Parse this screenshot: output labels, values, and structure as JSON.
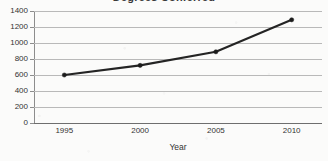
{
  "chart_data": {
    "type": "line",
    "title": "Degrees Conferred",
    "xlabel": "Year",
    "ylabel": "",
    "x": [
      1995,
      2000,
      2005,
      2010
    ],
    "categories": [
      "1995",
      "2000",
      "2005",
      "2010"
    ],
    "values": [
      600,
      720,
      890,
      1290
    ],
    "series": [
      {
        "name": "Degrees Conferred",
        "values": [
          600,
          720,
          890,
          1290
        ]
      }
    ],
    "xlim": [
      1993,
      2012
    ],
    "ylim": [
      0,
      1400
    ],
    "yticks": [
      0,
      200,
      400,
      600,
      800,
      1000,
      1200,
      1400
    ],
    "ytick_labels": [
      "0",
      "200",
      "400",
      "600",
      "800",
      "1000",
      "1200",
      "1400"
    ],
    "xticks": [
      1995,
      2000,
      2005,
      2010
    ],
    "xtick_labels": [
      "1995",
      "2000",
      "2005",
      "2010"
    ],
    "grid": true,
    "grid_axis": "y",
    "legend": false,
    "legend_position": "none",
    "marker": "circle",
    "line_color": "#242424",
    "marker_color": "#1c1c1c",
    "gridline_color": "#b9b9b9",
    "axis_color": "#8d8d8d",
    "background_color": "#fbfbfa",
    "title_clipped": true,
    "annotations": []
  }
}
